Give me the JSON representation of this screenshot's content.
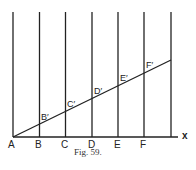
{
  "figure": {
    "caption": "Fig. 59.",
    "axis_label": "x",
    "base_points": [
      "A",
      "B",
      "C",
      "D",
      "E",
      "F"
    ],
    "line_points": [
      "B′",
      "C′",
      "D′",
      "E′",
      "F′"
    ],
    "colors": {
      "ink": "#222222",
      "background": "#ffffff"
    }
  }
}
